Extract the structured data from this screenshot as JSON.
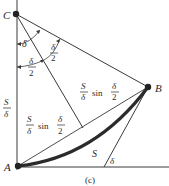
{
  "figure": {
    "caption": "(c)",
    "points": {
      "C": {
        "label": "C",
        "x": 16,
        "y": 14
      },
      "A": {
        "label": "A",
        "x": 18,
        "y": 166
      },
      "B": {
        "label": "B",
        "x": 148,
        "y": 87
      }
    },
    "labels": {
      "delta_top": "δ",
      "delta_half_right_num": "δ",
      "delta_half_right_den": "2",
      "delta_half_left_num": "δ",
      "delta_half_left_den": "2",
      "radius_num": "S",
      "radius_den": "δ",
      "half_chord_upper_num": "S",
      "half_chord_upper_den": "δ",
      "half_chord_upper_sin": "sin",
      "half_chord_upper_frac_num": "δ",
      "half_chord_upper_frac_den": "2",
      "half_chord_lower_num": "S",
      "half_chord_lower_den": "δ",
      "half_chord_lower_sin": "sin",
      "half_chord_lower_frac_num": "δ",
      "half_chord_lower_frac_den": "2",
      "arc_length": "S",
      "delta_bottom": "δ"
    },
    "colors": {
      "line": "#3a3a3a",
      "arc": "#2b2b2b",
      "text": "#2a2a2a"
    }
  }
}
